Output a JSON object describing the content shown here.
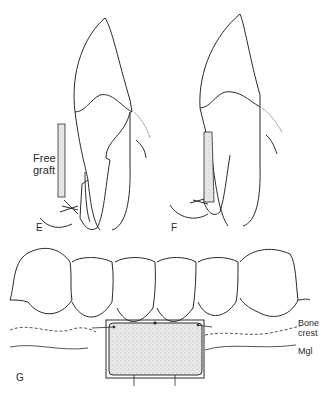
{
  "figure": {
    "panels": [
      {
        "id": "E",
        "label": "E",
        "annotations": [
          {
            "text_line1": "Free",
            "text_line2": "graft"
          }
        ]
      },
      {
        "id": "F",
        "label": "F"
      },
      {
        "id": "G",
        "label": "G",
        "annotations": [
          {
            "text_line1": "Bone",
            "text_line2": "crest"
          },
          {
            "text": "Mgl"
          }
        ]
      }
    ],
    "colors": {
      "line": "#2a2a2a",
      "graft_fill": "#e6e6e6",
      "gingiva": "#bbbbbb"
    }
  }
}
